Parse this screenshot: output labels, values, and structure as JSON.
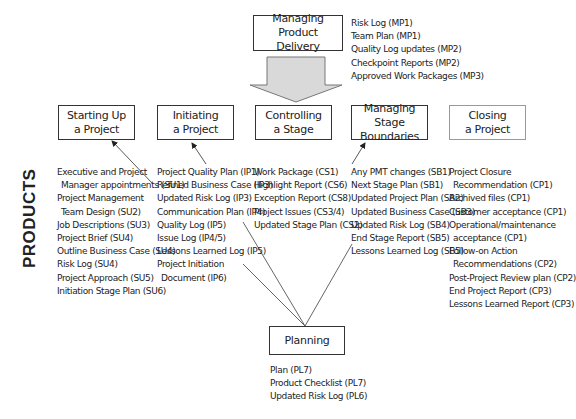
{
  "side_label": "PRODUCTS",
  "top_box": {
    "title": [
      "Managing Product",
      "Delivery"
    ],
    "products": [
      "Risk Log (MP1)",
      "Team Plan (MP1)",
      "Quality Log updates (MP2)",
      "Checkpoint Reports (MP2)",
      "Approved Work Packages (MP3)"
    ]
  },
  "processes": [
    {
      "title": [
        "Starting Up",
        "a Project"
      ],
      "products": [
        "Executive and Project",
        " Manager appointments (SU1)",
        "Project Management",
        " Team Design (SU2)",
        "Job Descriptions (SU3)",
        "Project Brief (SU4)",
        "Outline Business Case (SU4)",
        "Risk Log (SU4)",
        "Project Approach (SU5)",
        "Initiation Stage Plan (SU6)"
      ]
    },
    {
      "title": [
        "Initiating",
        "a Project"
      ],
      "products": [
        "Project Quality Plan (IP1)",
        "Refined Business Case (IP3)",
        "Updated Risk Log (IP3)",
        "Communication Plan (IP4)",
        "Quality Log (IP5)",
        "Issue Log (IP4/5)",
        "Lessons Learned Log (IP5)",
        "Project Initiation",
        " Document (IP6)"
      ]
    },
    {
      "title": [
        "Controlling",
        "a Stage"
      ],
      "products": [
        "Work Package (CS1)",
        "Highlight Report (CS6)",
        "Exception Report (CS8)",
        "Project Issues (CS3/4)",
        "Updated Stage Plan (CS2)"
      ]
    },
    {
      "title": [
        "Managing Stage",
        "Boundaries"
      ],
      "products": [
        "Any PMT changes (SB1)",
        "Next Stage Plan (SB1)",
        "Updated Project Plan (SB2)",
        "Updated Business Case (SB3)",
        "Updated Risk Log (SB4)",
        "End Stage Report (SB5)",
        "Lessons Learned Log (SB5)"
      ]
    },
    {
      "title": [
        "Closing",
        "a Project"
      ],
      "products": [
        "Project Closure",
        " Recommendation (CP1)",
        "Archived files (CP1)",
        "Customer acceptance (CP1)",
        "Operational/maintenance",
        " acceptance (CP1)",
        "Follow-on Action",
        " Recommendations (CP2)",
        "Post-Project Review plan (CP2)",
        "End Project Report (CP3)",
        "Lessons Learned Report (CP3)"
      ]
    }
  ],
  "bottom_box": {
    "title": [
      "Planning"
    ],
    "products": [
      "Plan (PL7)",
      "Product Checklist (PL7)",
      "Updated Risk Log (PL6)"
    ]
  },
  "colors": {
    "arrow_fill": "#d9d9d9",
    "arrow_stroke": "#777777",
    "line": "#444444"
  }
}
